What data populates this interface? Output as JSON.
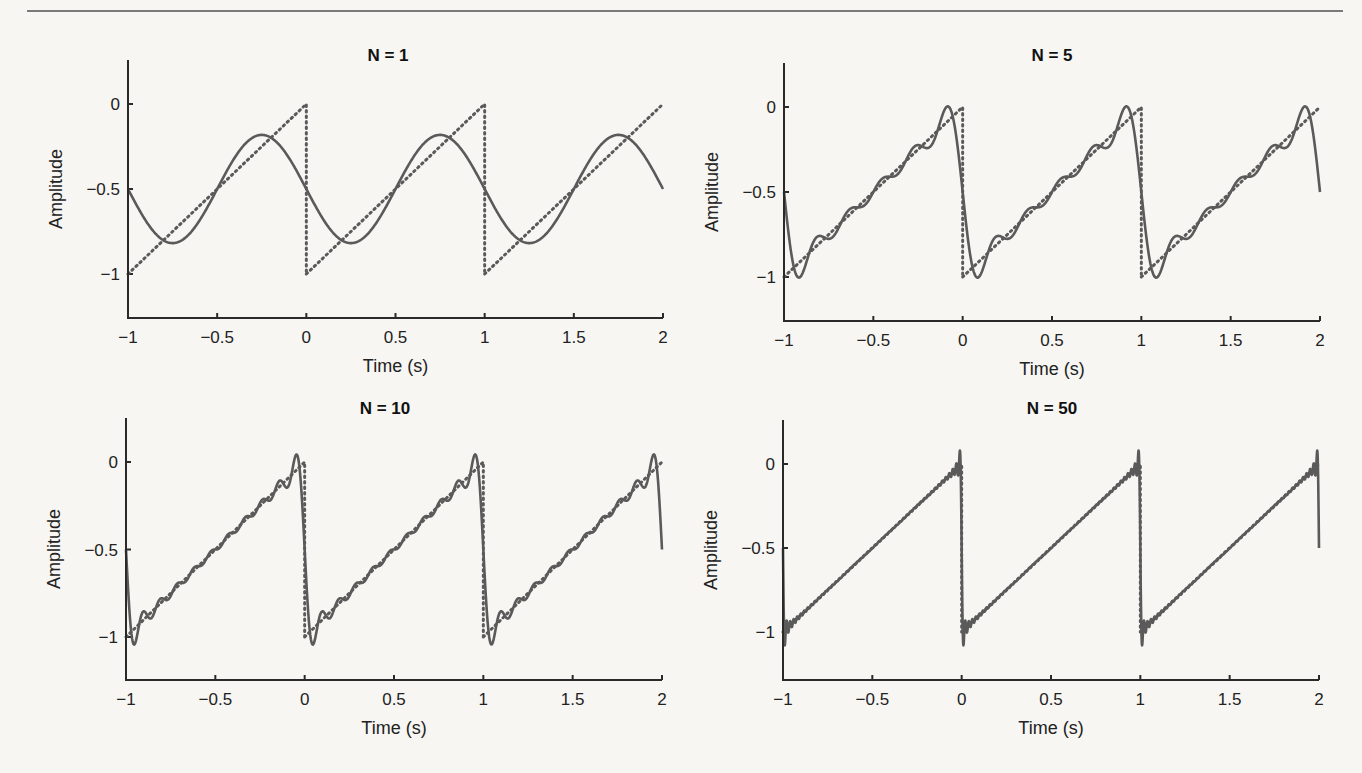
{
  "figure": {
    "background": "#f7f6f3",
    "line_color": "#5a5a5a"
  },
  "chart_data": [
    {
      "type": "line",
      "title": "N = 1",
      "xlabel": "Time (s)",
      "ylabel": "Amplitude",
      "xlim": [
        -1,
        2
      ],
      "ylim": [
        -1.25,
        0.25
      ],
      "xticks": [
        -1,
        -0.5,
        0,
        0.5,
        1,
        1.5,
        2
      ],
      "xtick_labels": [
        "−1",
        "−0.5",
        "0",
        "0.5",
        "1",
        "1.5",
        "2"
      ],
      "yticks": [
        0,
        -0.5,
        -1
      ],
      "ytick_labels": [
        "0",
        "−0.5",
        "−1"
      ],
      "grid": false,
      "series": [
        {
          "name": "Fourier approximation (N = 1 harmonics)",
          "style": "solid",
          "harmonics": 1,
          "period": 1,
          "offset": -0.5
        },
        {
          "name": "Ideal sawtooth",
          "style": "dotted",
          "function": "sawtooth from -1 to 0, period 1 s"
        }
      ]
    },
    {
      "type": "line",
      "title": "N = 5",
      "xlabel": "Time (s)",
      "ylabel": "Amplitude",
      "xlim": [
        -1,
        2
      ],
      "ylim": [
        -1.25,
        0.25
      ],
      "xticks": [
        -1,
        -0.5,
        0,
        0.5,
        1,
        1.5,
        2
      ],
      "xtick_labels": [
        "−1",
        "−0.5",
        "0",
        "0.5",
        "1",
        "1.5",
        "2"
      ],
      "yticks": [
        0,
        -0.5,
        -1
      ],
      "ytick_labels": [
        "0",
        "−0.5",
        "−1"
      ],
      "grid": false,
      "series": [
        {
          "name": "Fourier approximation (N = 5 harmonics)",
          "style": "solid",
          "harmonics": 5,
          "period": 1,
          "offset": -0.5
        },
        {
          "name": "Ideal sawtooth",
          "style": "dotted",
          "function": "sawtooth from -1 to 0, period 1 s"
        }
      ]
    },
    {
      "type": "line",
      "title": "N = 10",
      "xlabel": "Time (s)",
      "ylabel": "Amplitude",
      "xlim": [
        -1,
        2
      ],
      "ylim": [
        -1.25,
        0.25
      ],
      "xticks": [
        -1,
        -0.5,
        0,
        0.5,
        1,
        1.5,
        2
      ],
      "xtick_labels": [
        "−1",
        "−0.5",
        "0",
        "0.5",
        "1",
        "1.5",
        "2"
      ],
      "yticks": [
        0,
        -0.5,
        -1
      ],
      "ytick_labels": [
        "0",
        "−0.5",
        "−1"
      ],
      "grid": false,
      "series": [
        {
          "name": "Fourier approximation (N = 10 harmonics)",
          "style": "solid",
          "harmonics": 10,
          "period": 1,
          "offset": -0.5
        },
        {
          "name": "Ideal sawtooth",
          "style": "dotted",
          "function": "sawtooth from -1 to 0, period 1 s"
        }
      ]
    },
    {
      "type": "line",
      "title": "N = 50",
      "xlabel": "Time (s)",
      "ylabel": "Amplitude",
      "xlim": [
        -1,
        2
      ],
      "ylim": [
        -1.25,
        0.25
      ],
      "xticks": [
        -1,
        -0.5,
        0,
        0.5,
        1,
        1.5,
        2
      ],
      "xtick_labels": [
        "−1",
        "−0.5",
        "0",
        "0.5",
        "1",
        "1.5",
        "2"
      ],
      "yticks": [
        0,
        -0.5,
        -1
      ],
      "ytick_labels": [
        "0",
        "−0.5",
        "−1"
      ],
      "grid": false,
      "series": [
        {
          "name": "Fourier approximation (N = 50 harmonics)",
          "style": "solid",
          "harmonics": 50,
          "period": 1,
          "offset": -0.5
        },
        {
          "name": "Ideal sawtooth",
          "style": "dotted",
          "function": "sawtooth from -1 to 0, period 1 s"
        }
      ]
    }
  ],
  "panels_layout": [
    {
      "x0": 128,
      "x1": 663,
      "y_top_axis": 60,
      "y_zero": 104,
      "y_minus1": 274,
      "y_bottom": 318,
      "title_x": 388,
      "title_y": 61
    },
    {
      "x0": 784,
      "x1": 1320,
      "y_top_axis": 63,
      "y_zero": 107,
      "y_minus1": 277,
      "y_bottom": 321,
      "title_x": 1052,
      "title_y": 61
    },
    {
      "x0": 126,
      "x1": 662,
      "y_top_axis": 418,
      "y_zero": 462,
      "y_minus1": 637,
      "y_bottom": 680,
      "title_x": 385,
      "title_y": 414
    },
    {
      "x0": 783,
      "x1": 1319,
      "y_top_axis": 420,
      "y_zero": 464,
      "y_minus1": 632,
      "y_bottom": 680,
      "title_x": 1052,
      "title_y": 414
    }
  ]
}
